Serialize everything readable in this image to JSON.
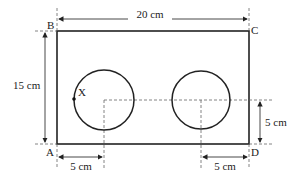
{
  "diagram": {
    "vertices": {
      "a": "A",
      "b": "B",
      "c": "C",
      "d": "D"
    },
    "point_label": "X",
    "dimensions": {
      "width": "20 cm",
      "height": "15 cm",
      "left_offset": "5 cm",
      "right_offset": "5 cm",
      "vertical_offset": "5 cm"
    },
    "colors": {
      "stroke": "#222222",
      "dash": "#555555"
    }
  }
}
